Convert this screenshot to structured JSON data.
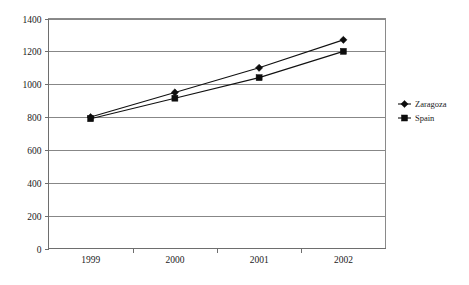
{
  "chart_data": {
    "type": "line",
    "title": "",
    "subtitle": "",
    "xlabel": "",
    "ylabel": "",
    "categories": [
      "1999",
      "2000",
      "2001",
      "2002"
    ],
    "series": [
      {
        "name": "Zaragoza",
        "marker": "diamond",
        "color": "#0d0d0d",
        "values": [
          800,
          950,
          1100,
          1270
        ]
      },
      {
        "name": "Spain",
        "marker": "square",
        "color": "#0d0d0d",
        "values": [
          790,
          915,
          1040,
          1200
        ]
      }
    ],
    "ylim": [
      0,
      1400
    ],
    "ytick_labels": [
      "0",
      "200",
      "400",
      "600",
      "800",
      "1000",
      "1200",
      "1400"
    ],
    "ytick_values": [
      0,
      200,
      400,
      600,
      800,
      1000,
      1200,
      1400
    ],
    "grid": true,
    "grid_axis": "y",
    "legend_position": "right"
  },
  "legend": {
    "items": [
      {
        "label": "Zaragoza",
        "marker": "diamond-icon"
      },
      {
        "label": "Spain",
        "marker": "square-icon"
      }
    ]
  }
}
